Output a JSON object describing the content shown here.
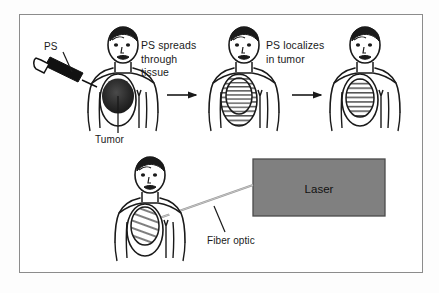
{
  "diagram": {
    "background_color": "#fdfdfd",
    "panel_color": "#ffffff",
    "border_color": "#8c8c8c",
    "ink_color": "#1a1a1a",
    "laser_box_color": "#808080",
    "steps": [
      {
        "index": 1,
        "caption": "PS spreads\nthrough\ntissue",
        "annotation": "PS",
        "tumor_label": "Tumor",
        "tumor_style": "solid-dark"
      },
      {
        "index": 2,
        "caption": "PS localizes\nin tumor",
        "tumor_style": "hatched-double"
      },
      {
        "index": 3,
        "caption": "",
        "tumor_style": "hatched-single"
      },
      {
        "index": 4,
        "caption": "",
        "annotation": "Fiber optic",
        "device_label": "Laser",
        "tumor_style": "hatched-diagonal"
      }
    ],
    "labels": {
      "ps": "PS",
      "spreads": "PS spreads\nthrough\ntissue",
      "localizes": "PS localizes\nin tumor",
      "tumor": "Tumor",
      "fiber_optic": "Fiber optic",
      "laser": "Laser"
    },
    "icons": {
      "syringe": "syringe-icon",
      "arrow_1": "arrow-right-icon",
      "arrow_2": "arrow-right-icon",
      "patient_1": "patient-figure-icon",
      "patient_2": "patient-figure-icon",
      "patient_3": "patient-figure-icon",
      "patient_4": "patient-figure-icon",
      "laser_box": "laser-device-icon",
      "fiber_line": "fiber-optic-line-icon"
    }
  }
}
